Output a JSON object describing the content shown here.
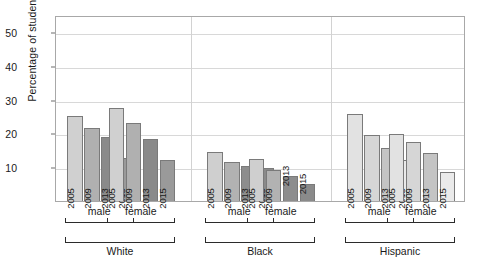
{
  "chart_data": {
    "type": "bar",
    "title": "",
    "xlabel": "",
    "ylabel": "Percentage of students smoking",
    "ylim": [
      0,
      55
    ],
    "yticks": [
      10,
      20,
      30,
      40,
      50
    ],
    "grid": true,
    "legend": "none",
    "categories": [
      "2005",
      "2009",
      "2013",
      "2015"
    ],
    "groups": [
      {
        "race": "White",
        "sex": "male",
        "values": [
          25.0,
          21.5,
          19.0,
          12.6
        ]
      },
      {
        "race": "White",
        "sex": "female",
        "values": [
          27.4,
          23.0,
          18.4,
          12.2
        ]
      },
      {
        "race": "Black",
        "sex": "male",
        "values": [
          14.6,
          11.5,
          10.4,
          9.8
        ]
      },
      {
        "race": "Black",
        "sex": "female",
        "values": [
          12.4,
          9.2,
          7.4,
          5.0
        ]
      },
      {
        "race": "Hispanic",
        "sex": "male",
        "values": [
          25.6,
          19.5,
          15.7,
          12.1
        ]
      },
      {
        "race": "Hispanic",
        "sex": "female",
        "values": [
          19.8,
          17.5,
          14.1,
          8.5
        ]
      }
    ],
    "series_colors": {
      "2005": "#d4d4d4",
      "2009": "#b4b4b4",
      "2013": "#8f8f8f",
      "2015": "#a3a3a3"
    },
    "group_colors": {
      "White": [
        "#d0d0d0",
        "#b0b0b0",
        "#8a8a8a",
        "#9a9a9a"
      ],
      "Black": [
        "#cfcfcf",
        "#b2b2b2",
        "#8d8d8d",
        "#8a8a8a"
      ],
      "Hispanic": [
        "#e2e2e2",
        "#d6d6d6",
        "#c4c4c4",
        "#eaeaea"
      ]
    },
    "sex_brackets": [
      "male",
      "female",
      "male",
      "female",
      "male",
      "female"
    ],
    "race_brackets": [
      "White",
      "Black",
      "Hispanic"
    ]
  }
}
